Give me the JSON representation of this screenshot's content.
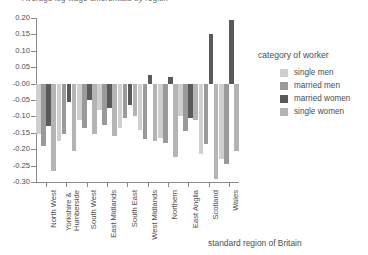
{
  "title_clipped": "Average log wage differentials by region",
  "axis": {
    "x_title": "standard region of Britain",
    "y_ticks": [
      "0.20",
      "0.15",
      "0.10",
      "0.05",
      "-0.00",
      "-0.05",
      "-0.10",
      "-0.15",
      "-0.20",
      "-0.25",
      "-0.30"
    ]
  },
  "legend": {
    "title": "category of worker",
    "items": [
      {
        "label": "single men",
        "color": "#cfcfcf"
      },
      {
        "label": "married men",
        "color": "#9a9a9a"
      },
      {
        "label": "married women",
        "color": "#5a5a5a"
      },
      {
        "label": "single women",
        "color": "#b4b4b4"
      }
    ]
  },
  "chart_data": {
    "type": "bar",
    "title": "Average log wage differentials by region",
    "xlabel": "standard region of Britain",
    "ylabel": "",
    "ylim": [
      -0.3,
      0.2
    ],
    "ytick_step": 0.05,
    "grid": false,
    "legend_position": "right",
    "legend_title": "category of worker",
    "categories": [
      "North West",
      "Yorkshire & Humberside",
      "South West",
      "East Midlands",
      "South East",
      "West Midlands",
      "Northern",
      "East Anglia",
      "Scotland",
      "Wales"
    ],
    "series": [
      {
        "name": "single men",
        "color": "#cfcfcf",
        "values": [
          -0.155,
          -0.175,
          -0.11,
          -0.08,
          -0.135,
          -0.14,
          -0.165,
          -0.1,
          -0.215,
          -0.23
        ]
      },
      {
        "name": "married men",
        "color": "#9a9a9a",
        "values": [
          -0.19,
          -0.155,
          -0.135,
          -0.125,
          -0.105,
          -0.17,
          -0.18,
          -0.145,
          -0.185,
          -0.245
        ]
      },
      {
        "name": "married women",
        "color": "#5a5a5a",
        "values": [
          -0.13,
          -0.055,
          -0.05,
          -0.075,
          -0.065,
          0.025,
          0.02,
          -0.105,
          0.15,
          0.195
        ]
      },
      {
        "name": "single women",
        "color": "#b4b4b4",
        "values": [
          -0.265,
          -0.205,
          -0.155,
          -0.16,
          -0.1,
          -0.175,
          -0.225,
          -0.11,
          -0.29,
          -0.205
        ]
      }
    ]
  }
}
